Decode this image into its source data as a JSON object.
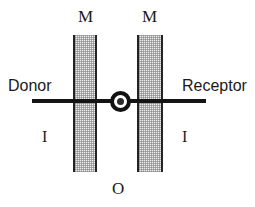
{
  "diagram": {
    "labels": {
      "membrane_left": "M",
      "membrane_right": "M",
      "donor": "Donor",
      "receptor": "Receptor",
      "interface_left": "I",
      "interface_right": "I",
      "outer": "O"
    },
    "icons": {
      "carrier_ring": "ring-icon",
      "carrier_core": "dot-icon"
    },
    "colors": {
      "background": "#ffffff",
      "line": "#141414",
      "membrane_fill": "#ededed",
      "membrane_border": "#242424",
      "text": "#1a1a1a"
    }
  }
}
